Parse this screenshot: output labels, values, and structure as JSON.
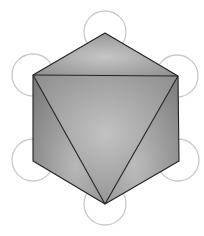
{
  "diagram": {
    "vertices": [
      {
        "id": "top",
        "x": 105,
        "y": 33
      },
      {
        "id": "upper-left",
        "x": 33,
        "y": 75
      },
      {
        "id": "upper-right",
        "x": 178,
        "y": 76
      },
      {
        "id": "lower-left",
        "x": 33,
        "y": 161
      },
      {
        "id": "lower-right",
        "x": 179,
        "y": 161
      },
      {
        "id": "bottom",
        "x": 105,
        "y": 204
      }
    ],
    "circle_radius": 21,
    "colors": {
      "circle_stroke": "#c8c8c8",
      "edge_stroke": "#222222",
      "face_light": "#c4c4c4",
      "face_mid": "#a8a8a8",
      "face_dark": "#858585",
      "background": "#ffffff"
    }
  },
  "caption": ""
}
